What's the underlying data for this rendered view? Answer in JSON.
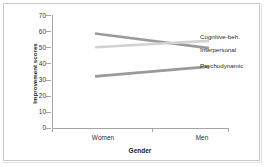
{
  "chart_data": {
    "type": "line",
    "title": "",
    "xlabel": "Gender",
    "ylabel": "Improvement scores",
    "categories": [
      "Women",
      "Men"
    ],
    "x": [
      0,
      1
    ],
    "ylim": [
      0,
      70
    ],
    "yticks": [
      0,
      10,
      20,
      30,
      40,
      50,
      60,
      70
    ],
    "ytick_labels": [
      "0",
      "10",
      "20",
      "30",
      "40",
      "50",
      "60",
      "70"
    ],
    "grid": false,
    "legend_position": "right",
    "series": [
      {
        "name": "Cognitive-beh.",
        "values": [
          58.5,
          49.5
        ],
        "color": "#9a9a9a"
      },
      {
        "name": "Interpersonal",
        "values": [
          50.0,
          54.0
        ],
        "color": "#d2d2d2"
      },
      {
        "name": "Psychodynamic",
        "values": [
          32.0,
          38.0
        ],
        "color": "#9a9a9a"
      }
    ]
  },
  "axis": {
    "y_title": "Improvement scores",
    "x_title": "Gender",
    "x_tick_labels": [
      "Women",
      "Men"
    ],
    "y_tick_labels": [
      "70",
      "60",
      "50",
      "40",
      "30",
      "20",
      "10",
      "0"
    ]
  },
  "legend": {
    "items": [
      {
        "label": "Cognitive-beh."
      },
      {
        "label": "Interpersonal"
      },
      {
        "label": "Psychodynamic"
      }
    ]
  },
  "colors": {
    "axis": "#a6a6a6",
    "frame": "#c9c9c9",
    "line_dark": "#9a9a9a",
    "line_light": "#d2d2d2",
    "text": "#2b2b2b"
  }
}
